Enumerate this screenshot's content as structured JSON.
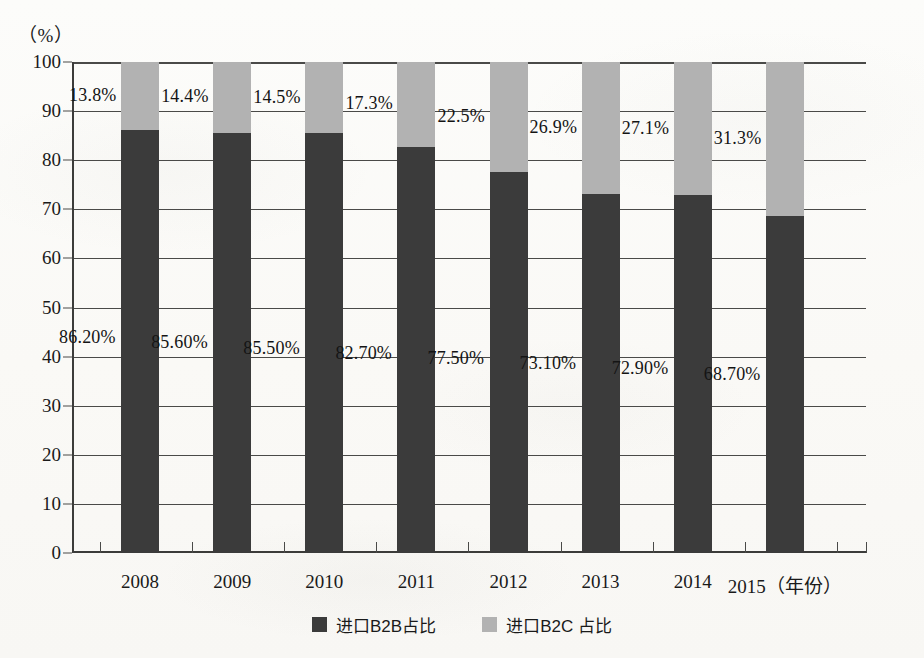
{
  "chart_data": {
    "type": "bar",
    "subtype": "stacked-bar-100",
    "title": "",
    "xlabel": "年份",
    "ylabel": "(%)",
    "unit_label": "（%）",
    "x_axis_unit_suffix": "（年份）",
    "ylim": [
      0,
      100
    ],
    "y_ticks": [
      0,
      10,
      20,
      30,
      40,
      50,
      60,
      70,
      80,
      90,
      100
    ],
    "y_tick_labels": [
      "0",
      "10",
      "20",
      "30",
      "40",
      "50",
      "60",
      "70",
      "80",
      "90",
      "100"
    ],
    "grid": true,
    "grid_axis": "y",
    "legend_position": "bottom-center",
    "categories": [
      "2008",
      "2009",
      "2010",
      "2011",
      "2012",
      "2013",
      "2014",
      "2015"
    ],
    "series": [
      {
        "name": "进口B2B占比",
        "key": "b2b",
        "color": "#3b3b3b",
        "values": [
          86.2,
          85.6,
          85.5,
          82.7,
          77.5,
          73.1,
          72.9,
          68.7
        ],
        "data_labels": [
          "86.20%",
          "85.60%",
          "85.50%",
          "82.70%",
          "77.50%",
          "73.10%",
          "72.90%",
          "68.70%"
        ]
      },
      {
        "name": "进口B2C 占比",
        "key": "b2c",
        "color": "#b2b2b2",
        "values": [
          13.8,
          14.4,
          14.5,
          17.3,
          22.5,
          26.9,
          27.1,
          31.3
        ],
        "data_labels": [
          "13.8%",
          "14.4%",
          "14.5%",
          "17.3%",
          "22.5%",
          "26.9%",
          "27.1%",
          "31.3%"
        ]
      }
    ]
  },
  "legend": {
    "items": [
      {
        "label": "进口B2B占比",
        "color": "#3b3b3b",
        "key": "b2b"
      },
      {
        "label": "进口B2C 占比",
        "color": "#b2b2b2",
        "key": "b2c"
      }
    ]
  },
  "colors": {
    "b2b": "#3b3b3b",
    "b2c": "#b2b2b2",
    "axis": "#3c3c3a",
    "grid": "#4a4a48",
    "background": "#fbfbf9",
    "text": "#1a1a1a"
  }
}
